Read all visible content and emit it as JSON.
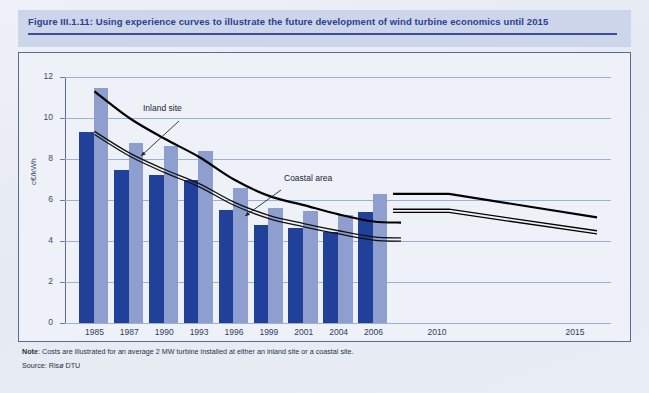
{
  "figure": {
    "title": "Figure III.1.11: Using experience curves to illustrate the future development of wind turbine economics until 2015",
    "note_label": "Note",
    "note_text": ": Costs are illustrated for an average 2 MW turbine installed at either an inland site or a coastal site.",
    "source": "Source: Risø DTU"
  },
  "colors": {
    "bar_dark": "#21409a",
    "bar_light": "#8e9ece",
    "header_band": "#ccd5e9",
    "title_text": "#2b3f8f",
    "plot_bg": "#eef1f8",
    "gridline": "#9fb0cf",
    "curve_inland": "#000000",
    "curve_coastal": "#111111",
    "frame": "#5a6a95"
  },
  "chart_data": {
    "type": "bar",
    "title": "Using experience curves to illustrate the future development of wind turbine economics until 2015",
    "xlabel": "",
    "ylabel": "c€/kWh",
    "ylim": [
      0,
      12
    ],
    "yticks": [
      0,
      2,
      4,
      6,
      8,
      10,
      12
    ],
    "grid": true,
    "legend": "none",
    "categories": [
      "1985",
      "1987",
      "1990",
      "1993",
      "1996",
      "1999",
      "2001",
      "2004",
      "2006"
    ],
    "projection_categories": [
      "2010",
      "2015"
    ],
    "series": [
      {
        "name": "Coastal area",
        "color": "#21409a",
        "values": [
          9.3,
          7.45,
          7.2,
          7.0,
          5.5,
          4.8,
          4.65,
          4.45,
          5.4
        ]
      },
      {
        "name": "Inland site",
        "color": "#8e9ece",
        "values": [
          11.45,
          8.8,
          8.65,
          8.4,
          6.6,
          5.6,
          5.45,
          5.25,
          6.3
        ]
      }
    ],
    "curves": [
      {
        "name": "Inland site",
        "style": "experience-curve",
        "x": [
          "1985",
          "1987",
          "1990",
          "1993",
          "1996",
          "1999",
          "2001",
          "2004",
          "2006"
        ],
        "y": [
          11.3,
          10.0,
          9.0,
          8.1,
          7.0,
          6.2,
          5.75,
          5.3,
          4.95
        ]
      },
      {
        "name": "Coastal area",
        "style": "experience-curve",
        "x": [
          "1985",
          "1987",
          "1990",
          "1993",
          "1996",
          "1999",
          "2001",
          "2004",
          "2006"
        ],
        "y": [
          9.35,
          8.3,
          7.5,
          6.8,
          5.9,
          5.25,
          4.85,
          4.5,
          4.2
        ]
      }
    ],
    "projections": [
      {
        "name": "Inland site projection",
        "x": [
          "2006",
          "2010",
          "2015"
        ],
        "y": [
          6.3,
          6.3,
          5.15
        ]
      },
      {
        "name": "Coastal area projection",
        "x": [
          "2006",
          "2010",
          "2015"
        ],
        "y": [
          5.55,
          5.55,
          4.5
        ]
      }
    ],
    "annotations": [
      {
        "text": "Inland site",
        "x": "1990",
        "y": 10.6
      },
      {
        "text": "Coastal area",
        "x": "1999",
        "y": 6.6
      }
    ]
  },
  "axis": {
    "y_ticks": [
      "12",
      "10",
      "8",
      "6",
      "4",
      "2",
      "0"
    ],
    "y_title": "c€/kWh",
    "x_ticks": [
      "1985",
      "1987",
      "1990",
      "1993",
      "1996",
      "1999",
      "2001",
      "2004",
      "2006",
      "2010",
      "2015"
    ]
  },
  "annotations": {
    "inland": "Inland site",
    "coastal": "Coastal area"
  }
}
